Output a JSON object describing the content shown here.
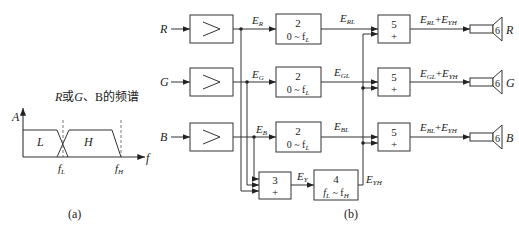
{
  "panel_a": {
    "title": "R或G、B的频谱",
    "y_axis_label": "A",
    "x_axis_label": "f",
    "band_low_label": "L",
    "band_high_label": "H",
    "tick_fL": "f",
    "tick_fL_sub": "L",
    "tick_fH": "f",
    "tick_fH_sub": "H",
    "caption": "(a)"
  },
  "panel_b": {
    "caption": "(b)",
    "inputs": [
      "R",
      "G",
      "B"
    ],
    "amplifier_symbol": ">",
    "signals": {
      "ER": {
        "main": "E",
        "sub": "R"
      },
      "EG": {
        "main": "E",
        "sub": "G"
      },
      "EB": {
        "main": "E",
        "sub": "B"
      },
      "ERL": {
        "main": "E",
        "sub": "RL"
      },
      "EGL": {
        "main": "E",
        "sub": "GL"
      },
      "EBL": {
        "main": "E",
        "sub": "BL"
      },
      "EY": {
        "main": "E",
        "sub": "Y"
      },
      "EYH": {
        "main": "E",
        "sub": "YH"
      }
    },
    "lowpass_block": {
      "number": "2",
      "range": "0 ~ f",
      "range_sub": "L"
    },
    "adder3_block": {
      "number": "3",
      "op": "+"
    },
    "bandpass_block": {
      "number": "4",
      "range_a": "f",
      "range_a_sub": "L",
      "range_mid": " ~ f",
      "range_b_sub": "H"
    },
    "adder5_block": {
      "number": "5",
      "op": "+"
    },
    "outputs": [
      {
        "sum": "E_RL + E_YH",
        "a": "E",
        "a_sub": "RL",
        "plus": "+",
        "b": "E",
        "b_sub": "YH",
        "speaker": "6",
        "channel": "R"
      },
      {
        "sum": "E_GL + E_YH",
        "a": "E",
        "a_sub": "GL",
        "plus": "+",
        "b": "E",
        "b_sub": "YH",
        "speaker": "6",
        "channel": "G"
      },
      {
        "sum": "E_BL + E_YH",
        "a": "E",
        "a_sub": "BL",
        "plus": "+",
        "b": "E",
        "b_sub": "YH",
        "speaker": "6",
        "channel": "B"
      }
    ]
  }
}
